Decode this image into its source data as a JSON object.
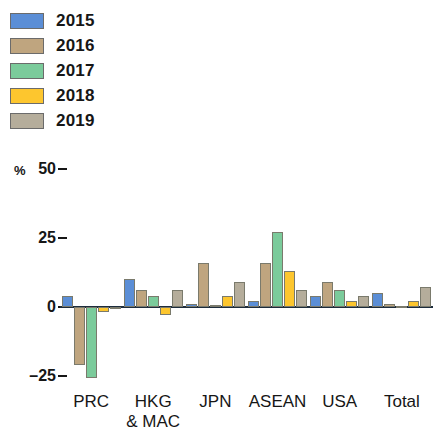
{
  "legend": {
    "items": [
      {
        "label": "2015",
        "color": "#5b8ed6",
        "icon": "legend-swatch"
      },
      {
        "label": "2016",
        "color": "#bfa57f",
        "icon": "legend-swatch"
      },
      {
        "label": "2017",
        "color": "#7bcb9b",
        "icon": "legend-swatch"
      },
      {
        "label": "2018",
        "color": "#fdc62e",
        "icon": "legend-swatch"
      },
      {
        "label": "2019",
        "color": "#b5ad9b",
        "icon": "legend-swatch"
      }
    ]
  },
  "axis": {
    "unit": "%",
    "yticks": [
      {
        "label": "50",
        "value": 50
      },
      {
        "label": "25",
        "value": 25
      },
      {
        "label": "0",
        "value": 0
      },
      {
        "label": "–25",
        "value": -25
      }
    ]
  },
  "chart_data": {
    "type": "bar",
    "title": "",
    "subtitle": "",
    "xlabel": "",
    "ylabel": "%",
    "ylim": [
      -32,
      55
    ],
    "grid": false,
    "legend_position": "top-left",
    "zero_line": true,
    "categories": [
      "PRC",
      "HKG & MAC",
      "JPN",
      "ASEAN",
      "USA",
      "Total"
    ],
    "category_labels": [
      {
        "line1": "PRC",
        "line2": ""
      },
      {
        "line1": "HKG",
        "line2": "& MAC"
      },
      {
        "line1": "JPN",
        "line2": ""
      },
      {
        "line1": "ASEAN",
        "line2": ""
      },
      {
        "line1": "USA",
        "line2": ""
      },
      {
        "line1": "Total",
        "line2": ""
      }
    ],
    "series": [
      {
        "name": "2015",
        "color": "#5b8ed6",
        "values": [
          4,
          10,
          1,
          2,
          4,
          5
        ]
      },
      {
        "name": "2016",
        "color": "#bfa57f",
        "values": [
          -21,
          6,
          16,
          16,
          9,
          1
        ]
      },
      {
        "name": "2017",
        "color": "#7bcb9b",
        "values": [
          -26,
          4,
          0.5,
          27,
          6,
          0.3
        ]
      },
      {
        "name": "2018",
        "color": "#fdc62e",
        "values": [
          -2,
          -3,
          4,
          13,
          2,
          2
        ]
      },
      {
        "name": "2019",
        "color": "#b5ad9b",
        "values": [
          -1,
          6,
          9,
          6,
          4,
          7
        ]
      }
    ]
  }
}
